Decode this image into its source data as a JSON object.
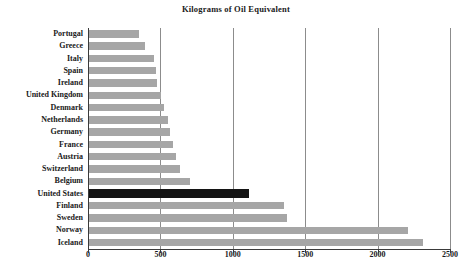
{
  "chart": {
    "subtitle": "Kilograms of Oil Equivalent",
    "bar_color": "#a6a6a6",
    "highlight_color": "#141414",
    "grid_color": "#8c8c8c",
    "axis_color": "#3a3a3a"
  },
  "chart_data": {
    "type": "bar",
    "orientation": "horizontal",
    "title": "",
    "subtitle": "Kilograms of Oil Equivalent",
    "xlabel": "",
    "ylabel": "",
    "xlim": [
      0,
      2500
    ],
    "xticks": [
      0,
      500,
      1000,
      1500,
      2000,
      2500
    ],
    "xtick_labels": [
      "0",
      "500",
      "1000",
      "1500",
      "2000",
      "2500"
    ],
    "grid": true,
    "legend": false,
    "highlight_category": "United States",
    "categories": [
      "Portugal",
      "Greece",
      "Italy",
      "Spain",
      "Ireland",
      "United Kingdom",
      "Denmark",
      "Netherlands",
      "Germany",
      "France",
      "Austria",
      "Switzerland",
      "Belgium",
      "United States",
      "Finland",
      "Sweden",
      "Norway",
      "Iceland"
    ],
    "values": [
      345,
      390,
      450,
      460,
      470,
      500,
      520,
      545,
      560,
      580,
      600,
      625,
      700,
      1105,
      1345,
      1370,
      2200,
      2305
    ]
  }
}
